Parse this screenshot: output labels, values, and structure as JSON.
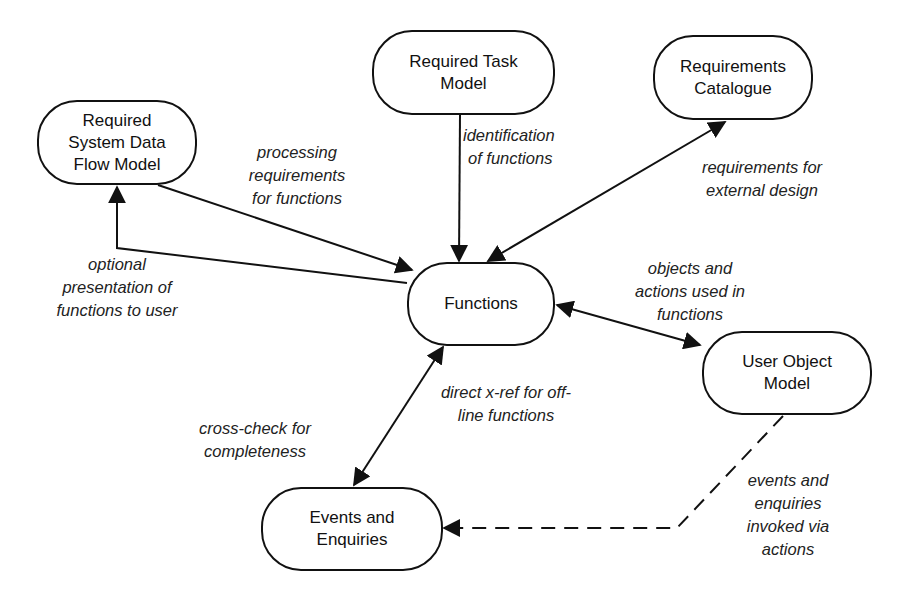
{
  "diagram": {
    "type": "data-flow / relationship diagram",
    "nodes": {
      "rsdfm": {
        "lines": [
          "Required",
          "System Data",
          "Flow Model"
        ]
      },
      "rtm": {
        "lines": [
          "Required Task",
          "Model"
        ]
      },
      "rc": {
        "lines": [
          "Requirements",
          "Catalogue"
        ]
      },
      "functions": {
        "lines": [
          "Functions"
        ]
      },
      "uom": {
        "lines": [
          "User Object",
          "Model"
        ]
      },
      "ee": {
        "lines": [
          "Events and",
          "Enquiries"
        ]
      }
    },
    "edges": {
      "processing": {
        "from": "Required System Data Flow Model",
        "to": "Functions",
        "style": "solid",
        "arrow": "end",
        "lines": [
          "processing",
          "requirements",
          "for functions"
        ]
      },
      "optional": {
        "from": "Functions",
        "to": "Required System Data Flow Model",
        "style": "solid",
        "arrow": "end",
        "lines": [
          "optional",
          "presentation of",
          "functions to user"
        ]
      },
      "identification": {
        "from": "Required Task Model",
        "to": "Functions",
        "style": "solid",
        "arrow": "end",
        "lines": [
          "identification",
          "of functions"
        ]
      },
      "external": {
        "from": "Requirements Catalogue",
        "to": "Functions",
        "style": "solid",
        "arrow": "both",
        "lines": [
          "requirements for",
          "external design"
        ]
      },
      "objects": {
        "from": "Functions",
        "to": "User Object Model",
        "style": "solid",
        "arrow": "both",
        "lines": [
          "objects and",
          "actions used in",
          "functions"
        ]
      },
      "xref": {
        "from": "Functions",
        "to": "Events and Enquiries",
        "style": "solid",
        "arrow": "both",
        "lines": [
          "direct x-ref for off-",
          "line functions"
        ]
      },
      "crosscheck": {
        "lines": [
          "cross-check for",
          "completeness"
        ]
      },
      "invoked": {
        "from": "User Object Model",
        "to": "Events and Enquiries",
        "style": "dashed",
        "arrow": "end",
        "lines": [
          "events and",
          "enquiries",
          "invoked via",
          "actions"
        ]
      }
    }
  }
}
